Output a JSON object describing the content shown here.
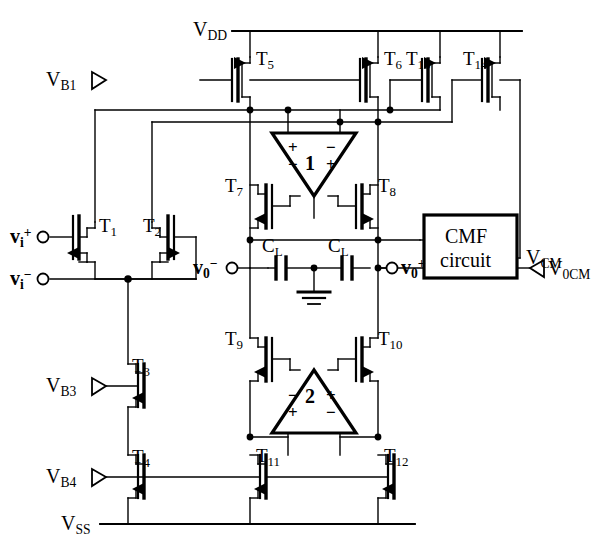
{
  "figure": {
    "kind": "circuit-schematic",
    "line_color": "#000000",
    "background": "#ffffff"
  },
  "rails": {
    "vdd": {
      "label_base": "V",
      "label_sub": "DD"
    },
    "vss": {
      "label_base": "V",
      "label_sub": "SS"
    }
  },
  "bias": [
    {
      "id": "vb1",
      "base": "V",
      "sub": "B1"
    },
    {
      "id": "vb3",
      "base": "V",
      "sub": "B3"
    },
    {
      "id": "vb4",
      "base": "V",
      "sub": "B4"
    }
  ],
  "inputs": [
    {
      "id": "vi-plus",
      "base": "v",
      "sub": "i",
      "sup": "+"
    },
    {
      "id": "vi-minus",
      "base": "v",
      "sub": "i",
      "sup": "−"
    }
  ],
  "outputs": [
    {
      "id": "vo-minus",
      "base": "v",
      "sub": "0",
      "sup": "−"
    },
    {
      "id": "vo-plus",
      "base": "v",
      "sub": "0",
      "sup": "+"
    }
  ],
  "transistors": [
    {
      "id": "T1",
      "base": "T",
      "sub": "1"
    },
    {
      "id": "T2",
      "base": "T",
      "sub": "2"
    },
    {
      "id": "T3",
      "base": "T",
      "sub": "3"
    },
    {
      "id": "T4",
      "base": "T",
      "sub": "4"
    },
    {
      "id": "T5",
      "base": "T",
      "sub": "5"
    },
    {
      "id": "T6",
      "base": "T",
      "sub": "6"
    },
    {
      "id": "T7",
      "base": "T",
      "sub": "7"
    },
    {
      "id": "T8",
      "base": "T",
      "sub": "8"
    },
    {
      "id": "T9",
      "base": "T",
      "sub": "9"
    },
    {
      "id": "T10",
      "base": "T",
      "sub": "10"
    },
    {
      "id": "T11",
      "base": "T",
      "sub": "11"
    },
    {
      "id": "T12",
      "base": "T",
      "sub": "12"
    },
    {
      "id": "T13",
      "base": "T",
      "sub": "13"
    },
    {
      "id": "T14",
      "base": "T",
      "sub": "14"
    }
  ],
  "capacitors": [
    {
      "id": "cl-left",
      "base": "C",
      "sub": "L"
    },
    {
      "id": "cl-right",
      "base": "C",
      "sub": "L"
    }
  ],
  "amplifiers": [
    {
      "id": "amp1",
      "number": "1",
      "orientation": "down",
      "left_signs": [
        "+",
        "−"
      ],
      "right_signs": [
        "−",
        "+"
      ]
    },
    {
      "id": "amp2",
      "number": "2",
      "orientation": "up",
      "left_signs": [
        "−",
        "+"
      ],
      "right_signs": [
        "+",
        "−"
      ]
    }
  ],
  "blocks": [
    {
      "id": "cmf",
      "line1": "CMF",
      "line2": "circuit"
    }
  ],
  "nets": [
    {
      "id": "vcm",
      "base": "V",
      "sub": "CM"
    },
    {
      "id": "v0cm",
      "base": "V",
      "sub": "0CM"
    }
  ],
  "symbols": {
    "ground": "ground-symbol",
    "terminal_open": "open-circle-terminal",
    "terminal_arrow": "arrow-terminal"
  }
}
